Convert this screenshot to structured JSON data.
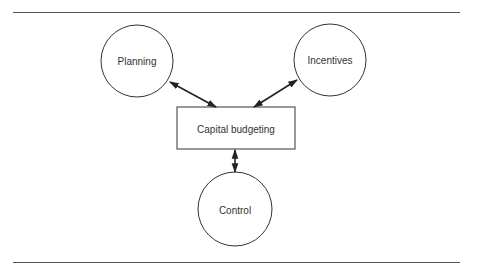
{
  "diagram": {
    "nodes": [
      {
        "id": "planning",
        "label": "Planning",
        "shape": "circle"
      },
      {
        "id": "incentives",
        "label": "Incentives",
        "shape": "circle"
      },
      {
        "id": "capital_budgeting",
        "label": "Capital budgeting",
        "shape": "rectangle"
      },
      {
        "id": "control",
        "label": "Control",
        "shape": "circle"
      }
    ],
    "edges": [
      {
        "from": "capital_budgeting",
        "to": "planning",
        "type": "bidirectional-arrow"
      },
      {
        "from": "capital_budgeting",
        "to": "incentives",
        "type": "bidirectional-arrow"
      },
      {
        "from": "capital_budgeting",
        "to": "control",
        "type": "bidirectional-arrow"
      }
    ],
    "stroke_color": "#333333",
    "background": "#ffffff"
  }
}
